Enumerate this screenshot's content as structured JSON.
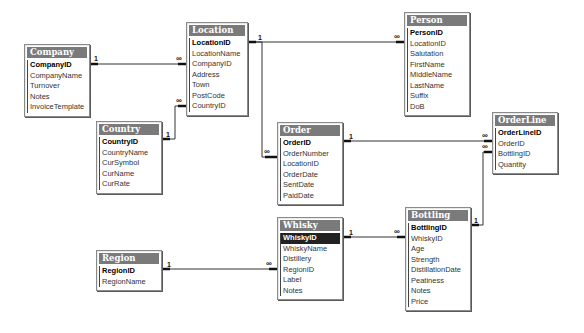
{
  "diagram": {
    "type": "relationships",
    "tables": [
      {
        "name": "Company",
        "x": 24,
        "y": 44,
        "w": 66,
        "fields": [
          {
            "name": "CompanyID",
            "pk": true
          },
          {
            "name": "CompanyName"
          },
          {
            "name": "Turnover"
          },
          {
            "name": "Notes"
          },
          {
            "name": "InvoiceTemplate"
          }
        ]
      },
      {
        "name": "Location",
        "x": 186,
        "y": 22,
        "w": 62,
        "fields": [
          {
            "name": "LocationID",
            "pk": true
          },
          {
            "name": "LocationName"
          },
          {
            "name": "CompanyID"
          },
          {
            "name": "Address"
          },
          {
            "name": "Town"
          },
          {
            "name": "PostCode"
          },
          {
            "name": "CountryID"
          }
        ]
      },
      {
        "name": "Person",
        "x": 404,
        "y": 12,
        "w": 66,
        "fields": [
          {
            "name": "PersonID",
            "pk": true
          },
          {
            "name": "LocationID"
          },
          {
            "name": "Salutation"
          },
          {
            "name": "FirstName"
          },
          {
            "name": "MiddleName"
          },
          {
            "name": "LastName"
          },
          {
            "name": "Suffix"
          },
          {
            "name": "DoB"
          }
        ]
      },
      {
        "name": "Country",
        "x": 96,
        "y": 121,
        "w": 66,
        "fields": [
          {
            "name": "CountryID",
            "pk": true
          },
          {
            "name": "CountryName"
          },
          {
            "name": "CurSymbol"
          },
          {
            "name": "CurName"
          },
          {
            "name": "CurRate"
          }
        ]
      },
      {
        "name": "Order",
        "x": 277,
        "y": 122,
        "w": 66,
        "fields": [
          {
            "name": "OrderID",
            "pk": true
          },
          {
            "name": "OrderNumber"
          },
          {
            "name": "LocationID"
          },
          {
            "name": "OrderDate"
          },
          {
            "name": "SentDate"
          },
          {
            "name": "PaidDate"
          }
        ]
      },
      {
        "name": "OrderLine",
        "x": 492,
        "y": 112,
        "w": 66,
        "fields": [
          {
            "name": "OrderLineID",
            "pk": true
          },
          {
            "name": "OrderID"
          },
          {
            "name": "BottlingID"
          },
          {
            "name": "Quantity"
          }
        ]
      },
      {
        "name": "Whisky",
        "x": 277,
        "y": 217,
        "w": 66,
        "fields": [
          {
            "name": "WhiskyID",
            "pk": true,
            "selected": true
          },
          {
            "name": "WhiskyName"
          },
          {
            "name": "Distillery"
          },
          {
            "name": "RegionID"
          },
          {
            "name": "Label"
          },
          {
            "name": "Notes"
          }
        ]
      },
      {
        "name": "Bottling",
        "x": 405,
        "y": 207,
        "w": 66,
        "fields": [
          {
            "name": "BottlingID",
            "pk": true
          },
          {
            "name": "WhiskyID"
          },
          {
            "name": "Age"
          },
          {
            "name": "Strength"
          },
          {
            "name": "DistillationDate"
          },
          {
            "name": "Peatiness"
          },
          {
            "name": "Notes"
          },
          {
            "name": "Price"
          }
        ]
      },
      {
        "name": "Region",
        "x": 96,
        "y": 250,
        "w": 66,
        "fields": [
          {
            "name": "RegionID",
            "pk": true
          },
          {
            "name": "RegionName"
          }
        ]
      }
    ],
    "relationships": [
      {
        "from": "Company.CompanyID",
        "to": "Location.CompanyID",
        "from_card": "1",
        "to_card": "∞"
      },
      {
        "from": "Country.CountryID",
        "to": "Location.CountryID",
        "from_card": "1",
        "to_card": "∞"
      },
      {
        "from": "Location.LocationID",
        "to": "Person.LocationID",
        "from_card": "1",
        "to_card": "∞"
      },
      {
        "from": "Location.LocationID",
        "to": "Order.LocationID",
        "from_card": "1",
        "to_card": "∞"
      },
      {
        "from": "Order.OrderID",
        "to": "OrderLine.OrderID",
        "from_card": "1",
        "to_card": "∞"
      },
      {
        "from": "Bottling.BottlingID",
        "to": "OrderLine.BottlingID",
        "from_card": "1",
        "to_card": "∞"
      },
      {
        "from": "Whisky.WhiskyID",
        "to": "Bottling.WhiskyID",
        "from_card": "1",
        "to_card": "∞"
      },
      {
        "from": "Region.RegionID",
        "to": "Whisky.RegionID",
        "from_card": "1",
        "to_card": "∞"
      }
    ],
    "labels": {
      "one": "1",
      "many": "∞"
    }
  }
}
